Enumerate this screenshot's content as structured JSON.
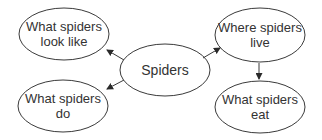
{
  "diagram": {
    "type": "concept-map",
    "colors": {
      "stroke": "#3a3a3a",
      "text": "#333333",
      "background": "#ffffff"
    },
    "center": {
      "id": "spiders",
      "label": "Spiders"
    },
    "nodes": [
      {
        "id": "look",
        "label": "What spiders\nlook like"
      },
      {
        "id": "live",
        "label": "Where spiders\nlive"
      },
      {
        "id": "do",
        "label": "What spiders\ndo"
      },
      {
        "id": "eat",
        "label": "What spiders\neat"
      }
    ],
    "edges": [
      {
        "from": "spiders",
        "to": "look"
      },
      {
        "from": "spiders",
        "to": "live"
      },
      {
        "from": "spiders",
        "to": "do"
      },
      {
        "from": "live",
        "to": "eat"
      }
    ]
  }
}
